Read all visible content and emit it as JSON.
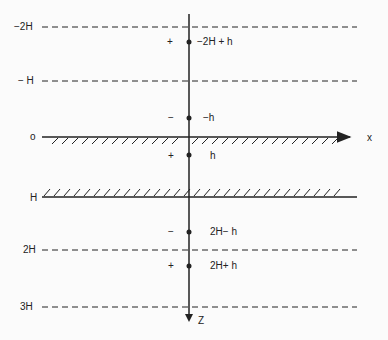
{
  "diagram": {
    "type": "method-of-images charge layout",
    "colors": {
      "ink": "#222222",
      "background": "#fbfbfb"
    },
    "axes": {
      "x_label": "x",
      "z_label": "Z"
    },
    "levels": [
      {
        "id": "minus-2H",
        "label": "−2H",
        "style": "dashed"
      },
      {
        "id": "minus-H",
        "label": "− H",
        "style": "dashed"
      },
      {
        "id": "zero",
        "label": "o",
        "style": "hatched-boundary"
      },
      {
        "id": "H",
        "label": "H",
        "style": "hatched-boundary"
      },
      {
        "id": "2H",
        "label": "2H",
        "style": "dashed"
      },
      {
        "id": "3H",
        "label": "3H",
        "style": "dashed"
      }
    ],
    "charges": [
      {
        "sign": "+",
        "position": "−2H + h"
      },
      {
        "sign": "−",
        "position": "−h"
      },
      {
        "sign": "+",
        "position": "h"
      },
      {
        "sign": "−",
        "position": "2H− h"
      },
      {
        "sign": "+",
        "position": "2H+ h"
      }
    ]
  }
}
